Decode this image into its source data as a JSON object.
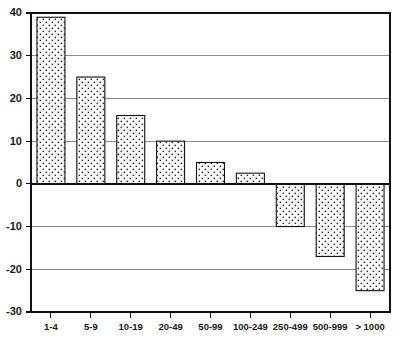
{
  "chart_data": {
    "type": "bar",
    "title": "",
    "subtitle": "",
    "xlabel": "",
    "ylabel": "",
    "categories": [
      "1-4",
      "5-9",
      "10-19",
      "20-49",
      "50-99",
      "100-249",
      "250-499",
      "500-999",
      "> 1000"
    ],
    "values": [
      39,
      25,
      16,
      10,
      5,
      2.5,
      -10,
      -17,
      -25
    ],
    "ylim": [
      -30,
      40
    ],
    "ytick_labels": [
      "40",
      "30",
      "20",
      "10",
      "0",
      "-10",
      "-20",
      "-30"
    ],
    "ytick_values": [
      40,
      30,
      20,
      10,
      0,
      -10,
      -20,
      -30
    ],
    "grid": true,
    "grid_axis": "y",
    "legend": "none",
    "annotations": [],
    "series": [
      {
        "name": "series-1",
        "values": [
          39,
          25,
          16,
          10,
          5,
          2.5,
          -10,
          -17,
          -25
        ]
      }
    ],
    "style": {
      "bar_fill": "#ffffff",
      "bar_pattern": "stipple-dots",
      "bar_pattern_color": "#2b2b2b",
      "bar_border": "#111111",
      "gridline_color": "#8c8c8c",
      "axis_color": "#111111",
      "background": "#ffffff"
    }
  }
}
